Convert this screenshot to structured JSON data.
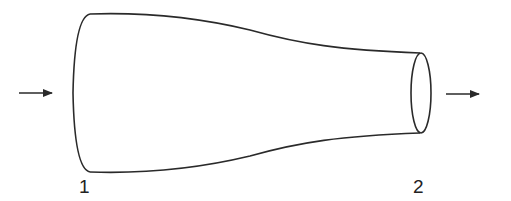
{
  "diagram": {
    "type": "converging duct / nozzle (flow through a tapered channel)",
    "stroke_color": "#2a2a2a",
    "background": "#ffffff",
    "sections": [
      {
        "id": "inlet",
        "label": "1"
      },
      {
        "id": "outlet",
        "label": "2"
      }
    ],
    "arrows": [
      {
        "id": "inflow",
        "direction": "right"
      },
      {
        "id": "outflow",
        "direction": "right"
      }
    ]
  }
}
